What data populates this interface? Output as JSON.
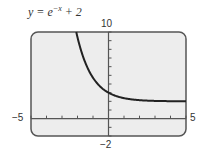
{
  "chart_data": {
    "type": "line",
    "title_parts": {
      "lhs": "y = e",
      "exp": "−x",
      "rhs": " + 2"
    },
    "xlabel": "",
    "ylabel": "",
    "xlim": [
      -5,
      5
    ],
    "ylim": [
      -2,
      10
    ],
    "xtick_step": 1,
    "ytick_step": 1,
    "grid": false,
    "window_labels": {
      "xmin": "−5",
      "xmax": "5",
      "ymin": "−2",
      "ymax": "10"
    },
    "series": [
      {
        "name": "y = e^{-x} + 2",
        "function": "exp(-x)+2",
        "x": [
          -2.08,
          -2,
          -1.5,
          -1,
          -0.5,
          0,
          0.5,
          1,
          1.5,
          2,
          3,
          4,
          5
        ],
        "y": [
          10.0,
          9.39,
          6.48,
          4.72,
          3.65,
          3.0,
          2.61,
          2.37,
          2.22,
          2.14,
          2.05,
          2.02,
          2.01
        ]
      }
    ],
    "colors": {
      "frame_bg": "#ededed",
      "frame_border": "#555555",
      "curve": "#222222",
      "axis": "#555555"
    }
  }
}
